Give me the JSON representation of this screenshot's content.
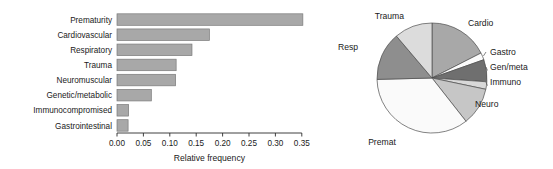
{
  "figure": {
    "background": "#ffffff",
    "bar_fill": "#a8a8a8",
    "bar_stroke": "#7a7a7a"
  },
  "chart_data": [
    {
      "type": "bar",
      "orientation": "horizontal",
      "title": "",
      "xlabel": "Relative frequency",
      "ylabel": "",
      "categories": [
        "Prematurity",
        "Cardiovascular",
        "Respiratory",
        "Trauma",
        "Neuromuscular",
        "Genetic/metabolic",
        "Immunocompromised",
        "Gastrointestinal"
      ],
      "values": [
        0.352,
        0.175,
        0.142,
        0.112,
        0.111,
        0.065,
        0.022,
        0.021
      ],
      "xlim": [
        0.0,
        0.37
      ],
      "xticks": [
        0.0,
        0.05,
        0.1,
        0.15,
        0.2,
        0.25,
        0.3,
        0.35
      ],
      "xticklabels": [
        "0.00",
        "0.05",
        "0.10",
        "0.15",
        "0.20",
        "0.25",
        "0.30",
        "0.35"
      ],
      "grid": false,
      "legend": "none"
    },
    {
      "type": "pie",
      "title": "",
      "labels": [
        "Cardio",
        "Gastro",
        "Gen/meta",
        "Immuno",
        "Neuro",
        "Premat",
        "Resp",
        "Trauma"
      ],
      "values": [
        0.175,
        0.021,
        0.065,
        0.022,
        0.111,
        0.352,
        0.142,
        0.112
      ],
      "colors": [
        "#a8a8a8",
        "#fbfbfb",
        "#6f6f6f",
        "#d8d8d8",
        "#c6c6c6",
        "#fafafa",
        "#8e8e8e",
        "#dcdcdc"
      ],
      "start_angle_deg": 90,
      "direction": "clockwise",
      "legend": "labels-outside",
      "label_positions": [
        "upper-right",
        "right",
        "right",
        "right",
        "lower-right",
        "lower-left",
        "left",
        "upper-left"
      ]
    }
  ],
  "bar_chart": {
    "axis_title": "Relative frequency",
    "categories": [
      {
        "label": "Prematurity",
        "value": 0.352
      },
      {
        "label": "Cardiovascular",
        "value": 0.175
      },
      {
        "label": "Respiratory",
        "value": 0.142
      },
      {
        "label": "Trauma",
        "value": 0.112
      },
      {
        "label": "Neuromuscular",
        "value": 0.111
      },
      {
        "label": "Genetic/metabolic",
        "value": 0.065
      },
      {
        "label": "Immunocompromised",
        "value": 0.022
      },
      {
        "label": "Gastrointestinal",
        "value": 0.021
      }
    ],
    "ticks": [
      {
        "label": "0.00",
        "value": 0.0
      },
      {
        "label": "0.05",
        "value": 0.05
      },
      {
        "label": "0.10",
        "value": 0.1
      },
      {
        "label": "0.15",
        "value": 0.15
      },
      {
        "label": "0.20",
        "value": 0.2
      },
      {
        "label": "0.25",
        "value": 0.25
      },
      {
        "label": "0.30",
        "value": 0.3
      },
      {
        "label": "0.35",
        "value": 0.35
      }
    ]
  },
  "pie_chart": {
    "slices": [
      {
        "label": "Cardio",
        "value": 0.175,
        "color": "#a8a8a8"
      },
      {
        "label": "Gastro",
        "value": 0.021,
        "color": "#fbfbfb"
      },
      {
        "label": "Gen/meta",
        "value": 0.065,
        "color": "#6f6f6f"
      },
      {
        "label": "Immuno",
        "value": 0.022,
        "color": "#d8d8d8"
      },
      {
        "label": "Neuro",
        "value": 0.111,
        "color": "#c6c6c6"
      },
      {
        "label": "Premat",
        "value": 0.352,
        "color": "#fafafa"
      },
      {
        "label": "Resp",
        "value": 0.142,
        "color": "#8e8e8e"
      },
      {
        "label": "Trauma",
        "value": 0.112,
        "color": "#dcdcdc"
      }
    ]
  }
}
